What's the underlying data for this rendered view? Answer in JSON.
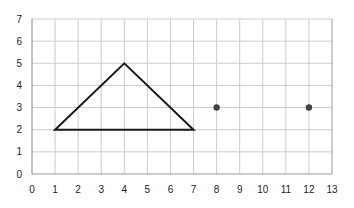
{
  "chart_data": {
    "type": "scatter",
    "title": "",
    "xlabel": "",
    "ylabel": "",
    "xlim": [
      0,
      13
    ],
    "ylim": [
      0,
      7
    ],
    "grid": true,
    "legend": null,
    "x_ticks": [
      "0",
      "1",
      "2",
      "3",
      "4",
      "5",
      "6",
      "7",
      "8",
      "9",
      "10",
      "11",
      "12",
      "13"
    ],
    "y_ticks": [
      "0",
      "1",
      "2",
      "3",
      "4",
      "5",
      "6",
      "7"
    ],
    "series": [
      {
        "name": "triangle",
        "kind": "polygon",
        "color": "#1a1a1a",
        "points": [
          [
            1,
            2
          ],
          [
            4,
            5
          ],
          [
            7,
            2
          ]
        ]
      },
      {
        "name": "points",
        "kind": "markers",
        "color": "#444444",
        "points": [
          [
            8,
            3
          ],
          [
            12,
            3
          ]
        ]
      }
    ]
  },
  "colors": {
    "grid": "#cccccc",
    "axis": "#999999",
    "line": "#1a1a1a",
    "marker": "#444444"
  }
}
